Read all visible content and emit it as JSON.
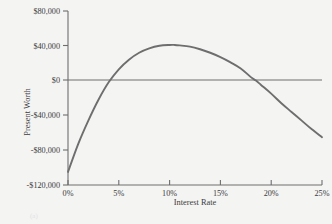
{
  "chart_data": {
    "type": "line",
    "title": "",
    "xlabel": "Interest Rate",
    "ylabel": "Present Worth",
    "xlim": [
      0,
      25
    ],
    "ylim": [
      -120000,
      80000
    ],
    "grid": false,
    "legend": null,
    "x_tick_labels": [
      "0%",
      "5%",
      "10%",
      "15%",
      "20%",
      "25%"
    ],
    "x_tick_values": [
      0,
      5,
      10,
      15,
      20,
      25
    ],
    "y_tick_labels": [
      "$80,000",
      "$40,000",
      "$0",
      "-$40,000",
      "-$80,000",
      "-$120,000"
    ],
    "y_tick_values": [
      80000,
      40000,
      0,
      -40000,
      -80000,
      -120000
    ],
    "zero_line": 0,
    "series": [
      {
        "name": "Present Worth",
        "color": "#6e6e6e",
        "x": [
          0,
          1,
          2,
          3,
          4,
          5,
          6,
          7,
          8,
          9,
          10,
          10.5,
          11,
          12,
          13,
          14,
          15,
          16,
          17,
          18,
          18.5,
          19,
          20,
          21,
          22,
          23,
          24,
          25
        ],
        "y": [
          -105000,
          -73000,
          -46000,
          -22000,
          -2000,
          13000,
          24000,
          32000,
          37000,
          40000,
          41000,
          41000,
          40500,
          39000,
          36000,
          32000,
          27000,
          21000,
          14000,
          4000,
          0,
          -5000,
          -15000,
          -26000,
          -36000,
          -46000,
          -56000,
          -65000
        ]
      }
    ],
    "annotations": {
      "zero_crossings": [
        4.2,
        18.5
      ],
      "peak": {
        "x": 10.5,
        "y": 41000
      }
    }
  },
  "axes": {
    "x_title": "Interest Rate",
    "y_title": "Present Worth"
  },
  "caption": "(a)",
  "colors": {
    "background": "#f4f4f3",
    "axis": "#6e6e6e",
    "curve": "#6e6e6e",
    "text": "#3b3b3b"
  }
}
